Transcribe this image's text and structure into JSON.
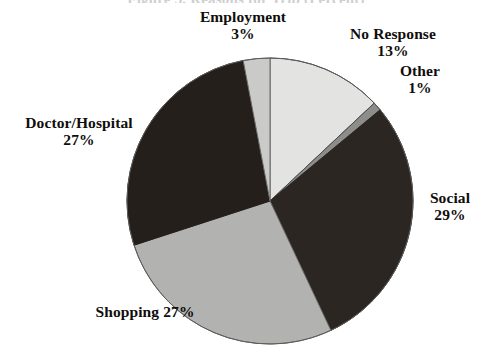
{
  "figure": {
    "title_remnant": "Figure 3. Reasons for Trip (Percent)",
    "background_color": "#ffffff"
  },
  "chart_data": {
    "type": "pie",
    "title": "",
    "xlabel": "",
    "ylabel": "",
    "legend_position": "none",
    "grid": false,
    "start_angle_deg": 0,
    "direction": "clockwise",
    "center": {
      "x": 270,
      "y": 201
    },
    "radius": 143,
    "units": "percent",
    "categories": [
      "No Response",
      "Other",
      "Social",
      "Shopping",
      "Doctor/Hospital",
      "Employment"
    ],
    "values": [
      13,
      1,
      29,
      27,
      27,
      3
    ],
    "slices": [
      {
        "label": "No Response",
        "value_text": "13%",
        "value": 13,
        "color": "#e3e3e1",
        "edge_color": "#4a4a4a"
      },
      {
        "label": "Other",
        "value_text": "1%",
        "value": 1,
        "color": "#8d8d8b",
        "edge_color": "#4a4a4a"
      },
      {
        "label": "Social",
        "value_text": "29%",
        "value": 29,
        "color": "#2c2622",
        "edge_color": "#2c2622"
      },
      {
        "label": "Shopping",
        "value_text": "27%",
        "value": 27,
        "color": "#b2b2b0",
        "edge_color": "#6a6a6a"
      },
      {
        "label": "Doctor/Hospital",
        "value_text": "27%",
        "value": 27,
        "color": "#251f1b",
        "edge_color": "#251f1b"
      },
      {
        "label": "Employment",
        "value_text": "3%",
        "value": 3,
        "color": "#cacac8",
        "edge_color": "#6a6a6a"
      }
    ]
  },
  "labels": {
    "employment": {
      "name": "Employment",
      "value": "3%"
    },
    "no_response": {
      "name": "No Response",
      "value": "13%"
    },
    "other": {
      "name": "Other",
      "value": "1%"
    },
    "doctor_hospital": {
      "name": "Doctor/Hospital",
      "value": "27%"
    },
    "social": {
      "name": "Social",
      "value": "29%"
    },
    "shopping": {
      "name": "Shopping",
      "value": "27%"
    }
  }
}
